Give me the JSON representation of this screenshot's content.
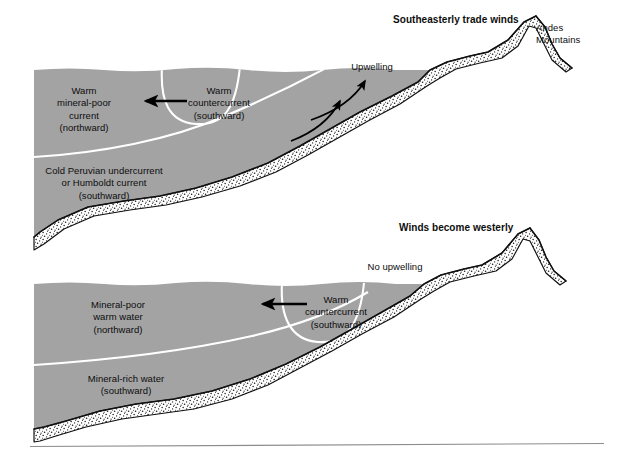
{
  "figure": {
    "colors": {
      "ocean_fill": "#a3a3a3",
      "sediment_fill": "#ffffff",
      "outline": "#111111",
      "current_line": "#ffffff",
      "arrow": "#000000",
      "text": "#0d0d0d",
      "rule": "#8c8c8c",
      "page_background": "#ffffff"
    }
  },
  "panels": [
    {
      "id": "normal-conditions",
      "name": "upper-panel",
      "wind_label": "Southeasterly trade winds",
      "landmass_label_line1": "Andes",
      "landmass_label_line2": "Mountains",
      "upwelling_label": "Upwelling",
      "surface_current": {
        "line1": "Warm",
        "line2": "mineral-poor",
        "line3": "current",
        "line4": "(northward)"
      },
      "countercurrent": {
        "line1": "Warm",
        "line2": "countercurrent",
        "line3": "(southward)"
      },
      "deep_current": {
        "line1": "Cold Peruvian undercurrent",
        "line2": "or Humboldt current",
        "line3": "(southward)"
      },
      "upwelling_arrow_count": 2,
      "countercurrent_arrow_direction": "left"
    },
    {
      "id": "el-nino-conditions",
      "name": "lower-panel",
      "wind_label": "Winds become westerly",
      "upwelling_label": "No upwelling",
      "surface_current": {
        "line1": "Mineral-poor",
        "line2": "warm water",
        "line3": "(northward)"
      },
      "countercurrent": {
        "line1": "Warm",
        "line2": "countercurrent",
        "line3": "(southward)"
      },
      "deep_current": {
        "line1": "Mineral-rich water",
        "line2": "(southward)"
      },
      "upwelling_arrow_count": 0,
      "countercurrent_arrow_direction": "left"
    }
  ]
}
